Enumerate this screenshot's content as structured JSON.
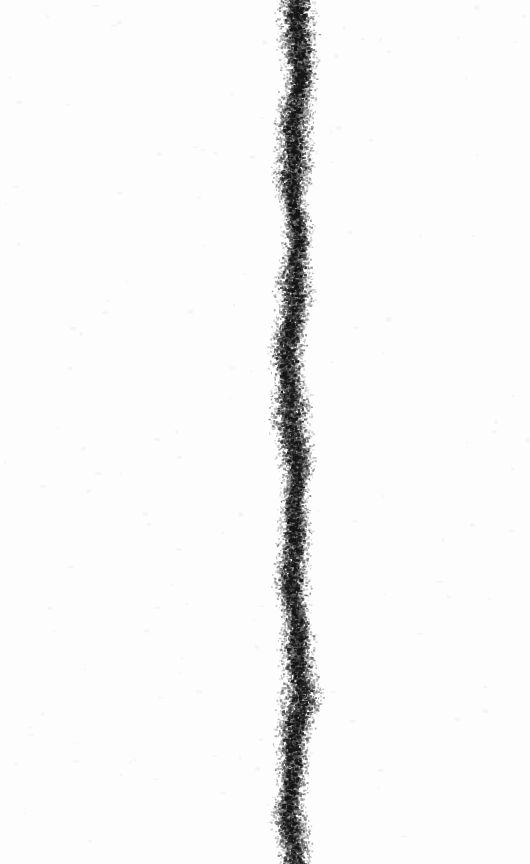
{
  "artwork": {
    "title": "Vertical Granular Stripe",
    "medium_appearance": "dense dark speckled band on white ground",
    "canvas": {
      "width": 530,
      "height": 864,
      "background_color": "#fefefe",
      "paper_tint": "#fcfcfc"
    },
    "stripe": {
      "name": "vertical-granular-band",
      "orientation": "vertical",
      "center_x": 293,
      "left_edge_x": 279,
      "right_edge_x": 307,
      "mean_width": 28,
      "width_min": 22,
      "width_max": 33,
      "top_y": 0,
      "bottom_y": 864,
      "bleeds_top": true,
      "bleeds_bottom": true,
      "grain_color_dark": "#141414",
      "grain_color_mid": "#4a4a4a",
      "grain_color_light": "#8e8e8e",
      "grain_count": 24000,
      "grain_size_min": 1,
      "grain_size_max": 3.2,
      "core_density": 0.92,
      "edge_feather": 0.42,
      "meander_amplitude": 3.4,
      "meander_wavelength": 210,
      "random_seed": 20240917
    },
    "speck_field": {
      "name": "background-stray-specks",
      "count": 140,
      "color": "#ededed",
      "opacity": 0.5
    }
  }
}
